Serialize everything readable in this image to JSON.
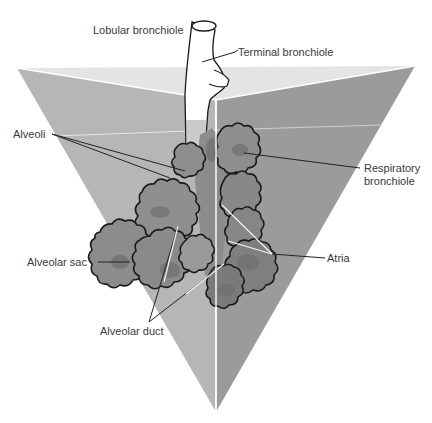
{
  "figure": {
    "type": "anatomical-diagram",
    "colors": {
      "top_face": "#e3e3e3",
      "left_face": "#b5b5b5",
      "right_face": "#9a9a9a",
      "alveoli_fill": "#8a8a8a",
      "alveoli_dark": "#6e6e6e",
      "outline": "#1a1a1a",
      "label_text": "#3a3a3a"
    }
  },
  "labels": {
    "lobular_bronchiole": "Lobular bronchiole",
    "terminal_bronchiole": "Terminal bronchiole",
    "alveoli": "Alveoli",
    "respiratory_bronchiole_line1": "Respiratory",
    "respiratory_bronchiole_line2": "bronchiole",
    "alveolar_sac": "Alveolar sac",
    "atria": "Atria",
    "alveolar_duct": "Alveolar duct"
  }
}
